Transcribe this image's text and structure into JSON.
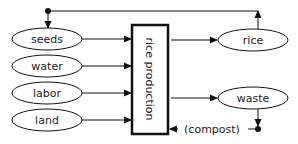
{
  "diagram": {
    "inputs": [
      {
        "label": "seeds"
      },
      {
        "label": "water"
      },
      {
        "label": "labor"
      },
      {
        "label": "land"
      }
    ],
    "process": {
      "label": "rice production"
    },
    "outputs": [
      {
        "label": "rice"
      },
      {
        "label": "waste"
      }
    ],
    "feedback": {
      "label": "(compost)"
    },
    "colors": {
      "stroke": "#111111",
      "background": "#ffffff",
      "text": "#222222"
    }
  }
}
